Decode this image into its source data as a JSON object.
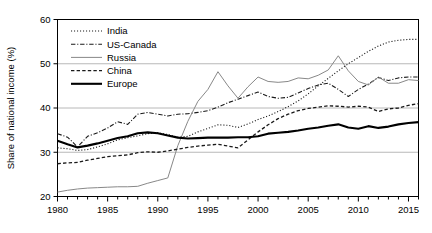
{
  "chart_data": {
    "type": "line",
    "title": "",
    "xlabel": "",
    "ylabel": "Share of national income (%)",
    "xlim": [
      1980,
      2016
    ],
    "ylim": [
      20,
      60
    ],
    "yticks": [
      20,
      30,
      40,
      50,
      60
    ],
    "ytick_labels": [
      "20",
      "30",
      "40",
      "50",
      "60"
    ],
    "xticks": [
      1980,
      1985,
      1990,
      1995,
      2000,
      2005,
      2010,
      2015
    ],
    "xtick_labels": [
      "1980",
      "1985",
      "1990",
      "1995",
      "2000",
      "2005",
      "2010",
      "2015"
    ],
    "minor_xtick_step": 1,
    "grid": "horizontal",
    "legend_position": "top-left",
    "x": [
      1980,
      1981,
      1982,
      1983,
      1984,
      1985,
      1986,
      1987,
      1988,
      1989,
      1990,
      1991,
      1992,
      1993,
      1994,
      1995,
      1996,
      1997,
      1998,
      1999,
      2000,
      2001,
      2002,
      2003,
      2004,
      2005,
      2006,
      2007,
      2008,
      2009,
      2010,
      2011,
      2012,
      2013,
      2014,
      2015,
      2016
    ],
    "series": [
      {
        "name": "India",
        "style": "dotted",
        "color": "#1a1a1a",
        "width": 1.1,
        "values": [
          31.0,
          30.8,
          30.4,
          30.6,
          31.2,
          31.9,
          32.8,
          33.3,
          33.7,
          34.2,
          34.4,
          34.0,
          33.4,
          33.6,
          34.6,
          35.4,
          36.2,
          36.1,
          35.6,
          36.4,
          37.4,
          38.2,
          39.2,
          40.3,
          41.6,
          43.2,
          45.0,
          46.7,
          48.4,
          50.0,
          51.4,
          52.8,
          54.0,
          54.9,
          55.3,
          55.5,
          55.5
        ]
      },
      {
        "name": "US-Canada",
        "style": "dashdot",
        "color": "#1a1a1a",
        "width": 1.1,
        "values": [
          34.2,
          33.4,
          31.2,
          33.6,
          34.4,
          35.5,
          36.9,
          36.3,
          38.6,
          39.0,
          38.6,
          38.2,
          38.6,
          38.7,
          39.0,
          39.4,
          40.2,
          41.2,
          42.0,
          42.8,
          43.6,
          42.6,
          42.2,
          42.4,
          43.4,
          44.4,
          45.2,
          45.6,
          44.2,
          42.6,
          44.2,
          45.4,
          46.9,
          46.2,
          46.8,
          47.0,
          47.0
        ]
      },
      {
        "name": "Russia",
        "style": "solid",
        "color": "#888888",
        "width": 1.0,
        "values": [
          21.0,
          21.4,
          21.7,
          21.9,
          22.0,
          22.1,
          22.2,
          22.2,
          22.3,
          23.0,
          23.6,
          24.2,
          31.5,
          37.0,
          41.5,
          44.2,
          48.2,
          45.0,
          42.2,
          44.8,
          47.0,
          46.0,
          45.8,
          46.0,
          46.8,
          46.6,
          47.4,
          48.6,
          51.8,
          48.4,
          46.0,
          45.2,
          47.0,
          45.6,
          45.6,
          46.4,
          46.2
        ]
      },
      {
        "name": "China",
        "style": "dashed",
        "color": "#1a1a1a",
        "width": 1.3,
        "values": [
          27.4,
          27.6,
          27.7,
          28.2,
          28.6,
          29.0,
          29.2,
          29.4,
          29.9,
          30.1,
          30.0,
          30.3,
          30.7,
          31.1,
          31.4,
          31.6,
          31.8,
          31.4,
          31.0,
          32.8,
          34.6,
          36.2,
          37.6,
          38.6,
          39.4,
          39.9,
          40.2,
          40.5,
          40.4,
          40.2,
          40.4,
          40.2,
          39.2,
          39.8,
          40.0,
          40.6,
          41.0
        ]
      },
      {
        "name": "Europe",
        "style": "solid",
        "color": "#000000",
        "width": 2.1,
        "values": [
          32.6,
          31.8,
          31.1,
          31.5,
          32.0,
          32.6,
          33.2,
          33.6,
          34.3,
          34.5,
          34.3,
          33.8,
          33.3,
          33.1,
          33.2,
          33.3,
          33.3,
          33.3,
          33.4,
          33.4,
          33.6,
          34.2,
          34.4,
          34.6,
          34.9,
          35.3,
          35.6,
          36.0,
          36.3,
          35.6,
          35.3,
          35.9,
          35.5,
          35.8,
          36.3,
          36.6,
          36.8
        ]
      }
    ]
  }
}
